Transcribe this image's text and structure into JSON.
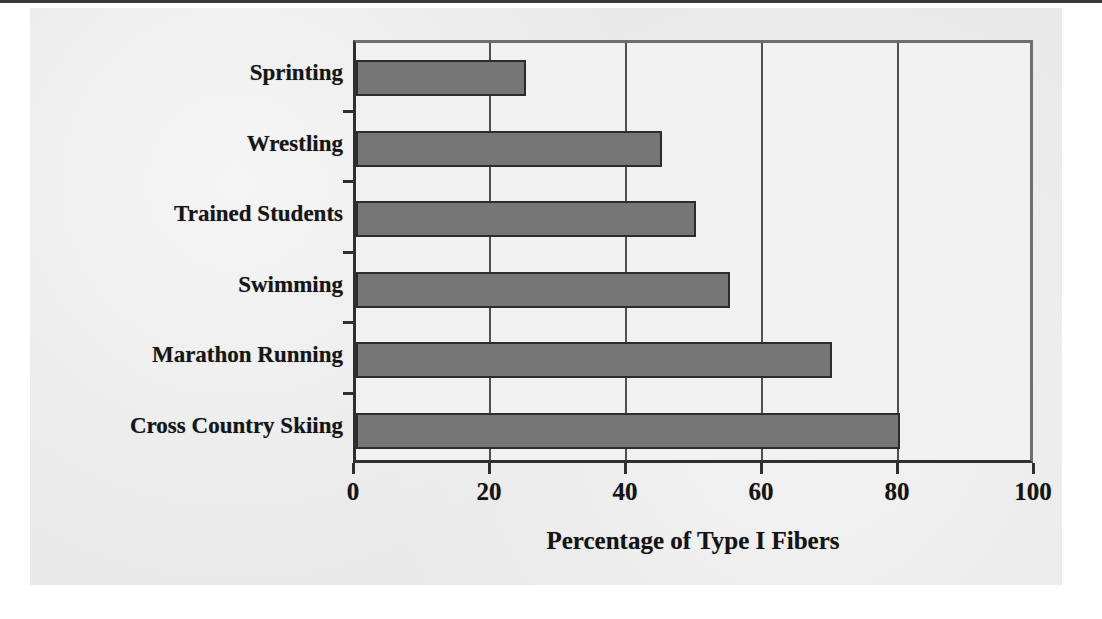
{
  "chart_data": {
    "type": "bar",
    "orientation": "horizontal",
    "title": "",
    "subtitle": "",
    "xlabel": "Percentage of Type I Fibers",
    "ylabel": "",
    "categories": [
      "Sprinting",
      "Wrestling",
      "Trained Students",
      "Swimming",
      "Marathon Running",
      "Cross Country Skiing"
    ],
    "values": [
      25,
      45,
      50,
      55,
      70,
      80
    ],
    "xlim": [
      0,
      100
    ],
    "xticks": [
      0,
      20,
      40,
      60,
      80,
      100
    ],
    "xtick_labels": [
      "0",
      "20",
      "40",
      "60",
      "80",
      "100"
    ],
    "gridlines": "vertical",
    "legend": "none",
    "colors": {
      "bar_fill": "#767676",
      "bar_border": "#2c2c2c",
      "plot_background": "#f1f1f1",
      "figure_background": "#e9e9e9",
      "axis": "#2f2f2f",
      "gridline": "#505050",
      "text": "#141414"
    }
  }
}
